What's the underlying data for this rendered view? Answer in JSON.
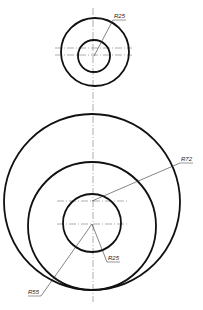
{
  "drawing": {
    "type": "technical-drawing",
    "line_color": "#111111",
    "centerline_color": "#777777",
    "dimensions": {
      "top_r25": "R25",
      "r72": "R72",
      "bottom_r25": "R25",
      "r55": "R55"
    }
  }
}
